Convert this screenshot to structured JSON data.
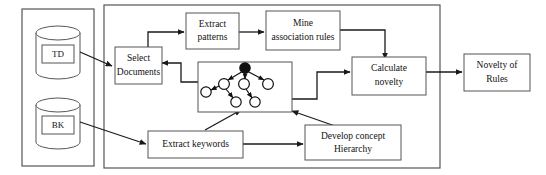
{
  "diagram": {
    "colors": {
      "box_stroke": "#555555",
      "connector": "#1a1a1a",
      "background": "#ffffff",
      "text": "#111111",
      "tree_root_fill": "#111111",
      "tree_node_fill": "#ffffff"
    },
    "data_stores": [
      {
        "id": "td",
        "label": "TD",
        "shape": "cylinder-icon"
      },
      {
        "id": "bk",
        "label": "BK",
        "shape": "cylinder-icon"
      }
    ],
    "process_boxes": [
      {
        "id": "select-documents",
        "line1": "Select",
        "line2": "Documents"
      },
      {
        "id": "extract-patterns",
        "line1": "Extract",
        "line2": "patterns"
      },
      {
        "id": "mine-association-rules",
        "line1": "Mine",
        "line2": "association rules"
      },
      {
        "id": "calculate-novelty",
        "line1": "Calculate",
        "line2": "novelty"
      },
      {
        "id": "novelty-of-rules",
        "line1": "Novelty of",
        "line2": "Rules"
      },
      {
        "id": "extract-keywords",
        "line1": "Extract keywords",
        "line2": ""
      },
      {
        "id": "develop-concept-hierarchy",
        "line1": "Develop concept",
        "line2": "Hierarchy"
      }
    ],
    "concept_tree": {
      "id": "concept-hierarchy-tree",
      "description": "concept hierarchy tree with one filled root node and eight open child nodes"
    }
  }
}
